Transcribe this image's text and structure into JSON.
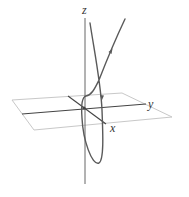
{
  "figure": {
    "axes": {
      "x_label": "x",
      "y_label": "y",
      "z_label": "z"
    },
    "colors": {
      "curve": "#5a5a5a",
      "axis": "#555555",
      "plane": "#c8c8c8",
      "label": "#333333"
    }
  }
}
